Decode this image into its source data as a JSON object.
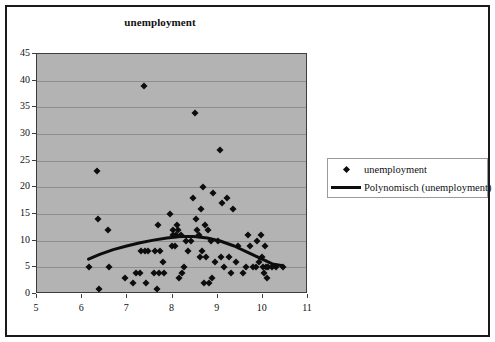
{
  "chart_data": {
    "type": "scatter",
    "title": "unemployment",
    "xlabel": "",
    "ylabel": "",
    "xlim": [
      5,
      11
    ],
    "ylim": [
      0,
      45
    ],
    "xticks": [
      5,
      6,
      7,
      8,
      9,
      10,
      11
    ],
    "yticks": [
      0,
      5,
      10,
      15,
      20,
      25,
      30,
      35,
      40,
      45
    ],
    "grid": "horizontal",
    "plot_background": "#b3b3b3",
    "marker_color": "#0d0d0d",
    "trendline_color": "#0d0d0d",
    "legend_position": "right",
    "legend": [
      {
        "label": "unemployment",
        "key": "diamond-marker"
      },
      {
        "label": "Polynomisch (unemployment)",
        "key": "thick-line"
      }
    ],
    "series": [
      {
        "name": "unemployment",
        "marker": "diamond",
        "points": [
          [
            6.15,
            5
          ],
          [
            6.32,
            23
          ],
          [
            6.35,
            14
          ],
          [
            6.38,
            1
          ],
          [
            6.58,
            12
          ],
          [
            6.6,
            5
          ],
          [
            6.95,
            3
          ],
          [
            7.12,
            2
          ],
          [
            7.2,
            4
          ],
          [
            7.28,
            4
          ],
          [
            7.3,
            8
          ],
          [
            7.38,
            39
          ],
          [
            7.4,
            8
          ],
          [
            7.42,
            2
          ],
          [
            7.45,
            8
          ],
          [
            7.6,
            4
          ],
          [
            7.62,
            8
          ],
          [
            7.66,
            1
          ],
          [
            7.68,
            13
          ],
          [
            7.7,
            4
          ],
          [
            7.72,
            8
          ],
          [
            7.78,
            6
          ],
          [
            7.82,
            4
          ],
          [
            7.95,
            15
          ],
          [
            7.98,
            9
          ],
          [
            8.0,
            12
          ],
          [
            8.02,
            11
          ],
          [
            8.05,
            9
          ],
          [
            8.08,
            11
          ],
          [
            8.1,
            13
          ],
          [
            8.12,
            12
          ],
          [
            8.14,
            3
          ],
          [
            8.18,
            11
          ],
          [
            8.2,
            4
          ],
          [
            8.25,
            5
          ],
          [
            8.3,
            10
          ],
          [
            8.35,
            8
          ],
          [
            8.4,
            10
          ],
          [
            8.45,
            18
          ],
          [
            8.5,
            34
          ],
          [
            8.52,
            14
          ],
          [
            8.55,
            12
          ],
          [
            8.58,
            11
          ],
          [
            8.6,
            7
          ],
          [
            8.62,
            16
          ],
          [
            8.65,
            8
          ],
          [
            8.68,
            20
          ],
          [
            8.7,
            2
          ],
          [
            8.72,
            13
          ],
          [
            8.75,
            7
          ],
          [
            8.78,
            12
          ],
          [
            8.8,
            2
          ],
          [
            8.85,
            10
          ],
          [
            8.88,
            3
          ],
          [
            8.9,
            19
          ],
          [
            8.95,
            6
          ],
          [
            9.0,
            10
          ],
          [
            9.05,
            27
          ],
          [
            9.08,
            7
          ],
          [
            9.1,
            17
          ],
          [
            9.15,
            5
          ],
          [
            9.2,
            18
          ],
          [
            9.25,
            7
          ],
          [
            9.3,
            4
          ],
          [
            9.35,
            16
          ],
          [
            9.4,
            6
          ],
          [
            9.45,
            9
          ],
          [
            9.55,
            4
          ],
          [
            9.62,
            5
          ],
          [
            9.68,
            11
          ],
          [
            9.72,
            9
          ],
          [
            9.78,
            5
          ],
          [
            9.85,
            5
          ],
          [
            9.88,
            10
          ],
          [
            9.92,
            6
          ],
          [
            9.95,
            11
          ],
          [
            9.98,
            7
          ],
          [
            10.0,
            5
          ],
          [
            10.02,
            4
          ],
          [
            10.05,
            9
          ],
          [
            10.08,
            5
          ],
          [
            10.1,
            3
          ],
          [
            10.12,
            5
          ],
          [
            10.2,
            5
          ],
          [
            10.3,
            5
          ],
          [
            10.45,
            5
          ]
        ]
      }
    ],
    "trendline": {
      "name": "Polynomisch (unemployment)",
      "type": "polynomial",
      "points": [
        [
          6.15,
          6.2
        ],
        [
          6.4,
          7.1
        ],
        [
          6.7,
          8.0
        ],
        [
          7.0,
          8.7
        ],
        [
          7.3,
          9.3
        ],
        [
          7.6,
          9.8
        ],
        [
          7.9,
          10.2
        ],
        [
          8.2,
          10.5
        ],
        [
          8.5,
          10.5
        ],
        [
          8.8,
          10.2
        ],
        [
          9.1,
          9.6
        ],
        [
          9.4,
          8.7
        ],
        [
          9.7,
          7.5
        ],
        [
          10.0,
          6.3
        ],
        [
          10.25,
          5.3
        ],
        [
          10.45,
          5.0
        ]
      ]
    }
  }
}
